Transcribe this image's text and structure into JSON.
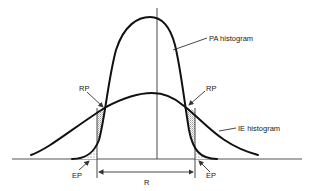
{
  "diagram": {
    "labels": {
      "pa_histogram": "PA histogram",
      "ie_histogram": "IE histogram",
      "rp_left": "RP",
      "rp_right": "RP",
      "ep_left": "EP",
      "ep_right": "EP",
      "range": "R"
    },
    "colors": {
      "curve": "#111111",
      "axis": "#555555",
      "hatch": "#999999",
      "background": "#ffffff"
    }
  }
}
